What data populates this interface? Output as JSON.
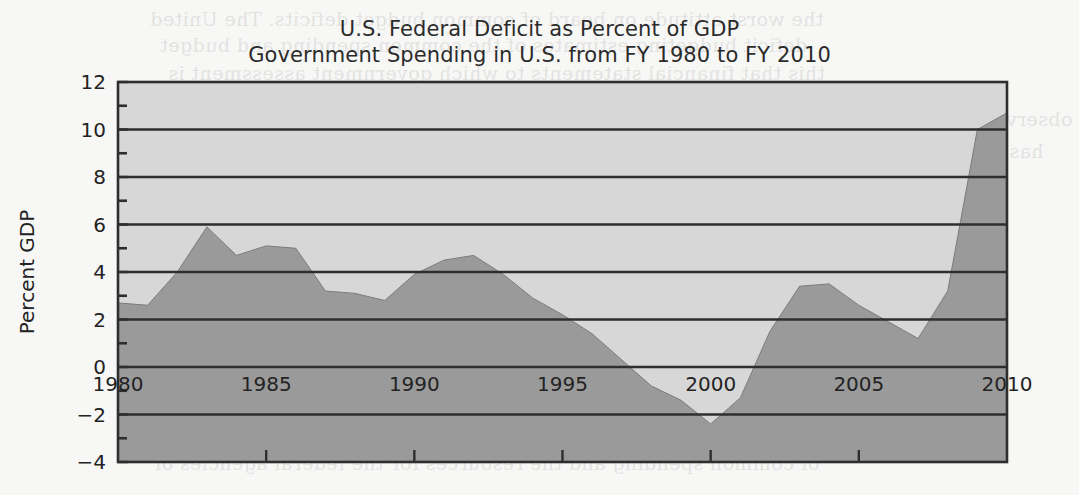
{
  "figure": {
    "title_line_1": "U.S. Federal Deficit as Percent of GDP",
    "title_line_2": "Government Spending in U.S. from FY 1980 to FY 2010",
    "background_color": "#f7f7f6",
    "plot_background_color": "#d7d7d7",
    "area_fill_color": "#9a9a9a",
    "axis_color": "#2e2e2e",
    "text_color": "#232323"
  },
  "scan_bleed": {
    "note": "faint mirrored show-through text from the reverse page of the scanned book",
    "lines": [
      {
        "text": "the worst attitude on board of common budget deficits. The United",
        "top": 8,
        "left": 150,
        "head": false
      },
      {
        "text": "deficit budgeting estimates of the common spending and budget",
        "top": 34,
        "left": 160,
        "head": false
      },
      {
        "text": "this that financial statements to which government assessment is",
        "top": 62,
        "left": 168,
        "head": false
      },
      {
        "text": "observed calculated as a direct view of accounts in each fiscal year of federal financing and",
        "top": 108,
        "left": 150,
        "head": false
      },
      {
        "text": "has to attribute spending the financial support the governments, and their responsibility",
        "top": 140,
        "left": 152,
        "head": false
      },
      {
        "text": "that the public spending. The same is that the budget level and the account of the",
        "top": 170,
        "left": 156,
        "head": false
      },
      {
        "text": "and the 2010 budget.",
        "top": 200,
        "left": 160,
        "head": false
      },
      {
        "text": "Budget",
        "top": 246,
        "left": 150,
        "head": true
      },
      {
        "text": "budget is mainly for the government of the federal spending",
        "top": 286,
        "left": 150,
        "head": false
      },
      {
        "text": "than account for the country level of the financing of these budgets",
        "top": 316,
        "left": 150,
        "head": false
      },
      {
        "text": "and account of federal budgets and the government deficits in",
        "top": 346,
        "left": 152,
        "head": false
      },
      {
        "text": "of an economic.",
        "top": 374,
        "left": 150,
        "head": false
      },
      {
        "text": "than the same budget for the Defense Department, and that should not",
        "top": 418,
        "left": 150,
        "head": false
      },
      {
        "text": "of common spending and the resources for the federal agencies of",
        "top": 452,
        "left": 154,
        "head": false
      }
    ]
  },
  "chart_data": {
    "type": "area",
    "title": "U.S. Federal Deficit as Percent of GDP\nGovernment Spending in U.S. from FY 1980 to FY 2010",
    "xlabel": "",
    "ylabel": "Percent GDP",
    "xlim": [
      1980,
      2010
    ],
    "ylim": [
      -4,
      12
    ],
    "grid": true,
    "grid_axis": "y",
    "legend": false,
    "y_major_ticks": [
      -4,
      -2,
      0,
      2,
      4,
      6,
      8,
      10,
      12
    ],
    "y_minor_ticks": [
      -3,
      -1,
      1,
      3,
      5,
      7,
      9,
      11
    ],
    "y_tick_labels": [
      "−4",
      "−2",
      "0",
      "2",
      "4",
      "6",
      "8",
      "10",
      "12"
    ],
    "x_major_ticks": [
      1980,
      1985,
      1990,
      1995,
      2000,
      2005,
      2010
    ],
    "x_tick_labels": [
      "1980",
      "1985",
      "1990",
      "1995",
      "2000",
      "2005",
      "2010"
    ],
    "x_minor_ticks": [
      1981,
      1982,
      1983,
      1984,
      1986,
      1987,
      1988,
      1989,
      1991,
      1992,
      1993,
      1994,
      1996,
      1997,
      1998,
      1999,
      2001,
      2002,
      2003,
      2004,
      2006,
      2007,
      2008,
      2009
    ],
    "baseline": -4,
    "series": [
      {
        "name": "U.S. Federal Deficit (percent of GDP)",
        "x": [
          1980,
          1981,
          1982,
          1983,
          1984,
          1985,
          1986,
          1987,
          1988,
          1989,
          1990,
          1991,
          1992,
          1993,
          1994,
          1995,
          1996,
          1997,
          1998,
          1999,
          2000,
          2001,
          2002,
          2003,
          2004,
          2005,
          2006,
          2007,
          2008,
          2009,
          2010
        ],
        "values": [
          2.7,
          2.6,
          4.0,
          5.9,
          4.7,
          5.1,
          5.0,
          3.2,
          3.1,
          2.8,
          3.9,
          4.5,
          4.7,
          3.9,
          2.9,
          2.2,
          1.4,
          0.3,
          -0.8,
          -1.4,
          -2.4,
          -1.3,
          1.5,
          3.4,
          3.5,
          2.6,
          1.9,
          1.2,
          3.2,
          10.0,
          10.7
        ]
      }
    ],
    "annotations": []
  },
  "plot_geometry": {
    "note": "pixel geometry of the axes box within the 1079x495 figure",
    "left": 118,
    "right": 1007,
    "top": 82,
    "bottom": 462
  }
}
